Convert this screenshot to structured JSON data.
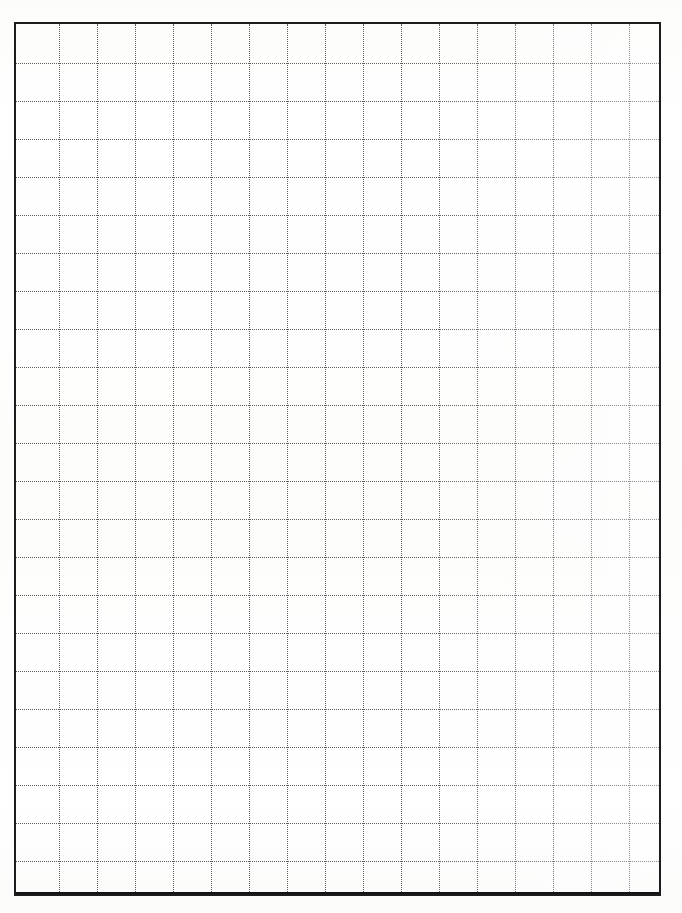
{
  "document": {
    "kind": "scanned-grid-paper",
    "title": "Blank grid paper sheet",
    "page_width": 682,
    "page_height": 913,
    "background_color": "#ffffff",
    "text_content": "",
    "annotations": []
  },
  "frame": {
    "name": "grid-border",
    "left": 14,
    "top": 22,
    "width": 647,
    "height": 874,
    "border_color": "#1c1c1c",
    "border_width_px": 2
  },
  "grid": {
    "line_color": "#5e5e5e",
    "line_style": "dotted",
    "line_width_px": 1,
    "cell_size_px": 38,
    "columns": 17,
    "rows": 23,
    "vertical_line_offsets": [
      43,
      81,
      119,
      157,
      195,
      233,
      271,
      309,
      347,
      385,
      423,
      461,
      499,
      537,
      575,
      613
    ],
    "horizontal_line_offsets": [
      39,
      77,
      115,
      153,
      191,
      229,
      267,
      305,
      343,
      381,
      419,
      457,
      495,
      533,
      571,
      609,
      647,
      685,
      723,
      761,
      799,
      837
    ]
  },
  "chart_data": {
    "type": "table",
    "title": "",
    "xlabel": "",
    "ylabel": "",
    "categories": [],
    "values": [],
    "grid": true,
    "legend": "none",
    "note": "Empty grid paper: 17 columns by 23 rows of dotted cells, no plotted data."
  }
}
